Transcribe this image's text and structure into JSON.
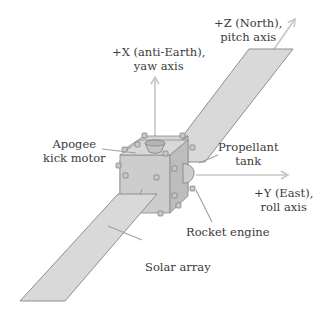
{
  "diagram": {
    "labels": {
      "z_axis": {
        "line1": "+Z (North),",
        "line2": "pitch axis"
      },
      "x_axis": {
        "line1": "+X (anti-Earth),",
        "line2": "yaw axis"
      },
      "y_axis": {
        "line1": "+Y (East),",
        "line2": "roll axis"
      },
      "apogee_motor": {
        "line1": "Apogee",
        "line2": "kick motor"
      },
      "propellant_tank": {
        "line1": "Propellant",
        "line2": "tank"
      },
      "rocket_engine": "Rocket engine",
      "solar_array": "Solar array"
    },
    "colors": {
      "panel_fill": "#d9d9d9",
      "panel_stroke": "#8f8f8f",
      "body_fill": "#cfcfcf",
      "body_side": "#bdbdbd",
      "arrow": "#c6c6c6",
      "leader": "#a0a0a0",
      "text": "#3a3a3a"
    }
  }
}
